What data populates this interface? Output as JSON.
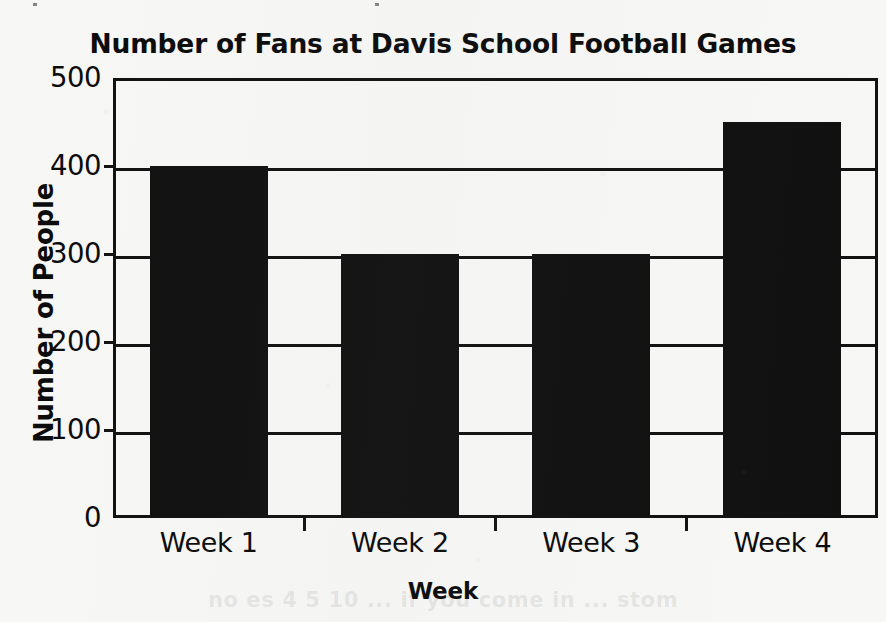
{
  "chart_data": {
    "type": "bar",
    "title": "Number of Fans at Davis School Football Games",
    "xlabel": "Week",
    "ylabel": "Number of People",
    "categories": [
      "Week 1",
      "Week 2",
      "Week 3",
      "Week 4"
    ],
    "values": [
      400,
      300,
      300,
      450
    ],
    "ylim": [
      0,
      500
    ],
    "ytick_labels": [
      "0",
      "100",
      "200",
      "300",
      "400",
      "500"
    ],
    "ytick_values": [
      0,
      100,
      200,
      300,
      400,
      500
    ],
    "grid": true,
    "legend": "none",
    "bar_color": "#101010",
    "axis_color": "#111111",
    "background_color": "#f7f7f5"
  },
  "ghost_text": "no  es 4 5 10  ... if you come in   ... stom"
}
